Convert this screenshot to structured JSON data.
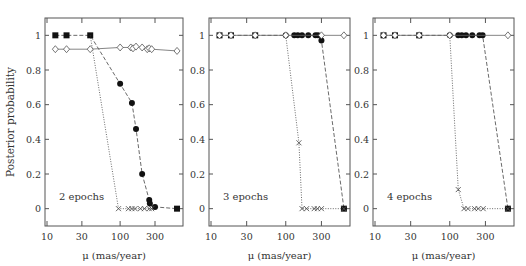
{
  "figure": {
    "ylabel": "Posterior probability",
    "xlabel": "μ (mas/year)"
  },
  "chart_data": [
    {
      "type": "line",
      "title": "2 epochs",
      "xlabel": "μ (mas/year)",
      "ylabel": "Posterior probability",
      "xscale": "log",
      "xlim": [
        10,
        680
      ],
      "ylim": [
        -0.1,
        1.1
      ],
      "xticks": [
        10,
        30,
        100,
        300
      ],
      "yticks": [
        0,
        0.2,
        0.4,
        0.6,
        0.8,
        1
      ],
      "ytick_labels": [
        "0",
        "0.2",
        "0.4",
        "0.6",
        "0.8",
        "1"
      ],
      "series": [
        {
          "name": "filled",
          "marker": "square/circle filled",
          "line": "dashed",
          "x": [
            13,
            18.5,
            39,
            100,
            145,
            165,
            200,
            250,
            255,
            300,
            600
          ],
          "y": [
            1,
            1,
            1,
            0.72,
            0.61,
            0.46,
            0.2,
            0.05,
            0.03,
            0.01,
            0.0
          ]
        },
        {
          "name": "cross",
          "marker": "x",
          "line": "dotted",
          "x": [
            39,
            95,
            130,
            145,
            160,
            190,
            215,
            250,
            270
          ],
          "y": [
            1,
            0,
            0,
            0,
            0,
            0,
            0,
            0,
            0
          ]
        },
        {
          "name": "open",
          "marker": "diamond open",
          "line": "solid",
          "x": [
            13,
            18.5,
            39,
            100,
            140,
            150,
            165,
            200,
            235,
            250,
            270,
            600
          ],
          "y": [
            0.92,
            0.92,
            0.92,
            0.93,
            0.93,
            0.925,
            0.935,
            0.93,
            0.92,
            0.925,
            0.92,
            0.91
          ]
        }
      ]
    },
    {
      "type": "line",
      "title": "3 epochs",
      "xlabel": "μ (mas/year)",
      "xscale": "log",
      "xlim": [
        10,
        680
      ],
      "ylim": [
        -0.1,
        1.1
      ],
      "xticks": [
        10,
        30,
        100,
        300
      ],
      "yticks": [
        0,
        0.2,
        0.4,
        0.6,
        0.8,
        1
      ],
      "ytick_labels": [
        "0",
        "0.2",
        "0.4",
        "0.6",
        "0.8",
        "1"
      ],
      "series": [
        {
          "name": "filled",
          "marker": "square/circle filled",
          "line": "dashed",
          "x": [
            13,
            18.5,
            39,
            100,
            130,
            145,
            165,
            200,
            250,
            270,
            300,
            600
          ],
          "y": [
            1,
            1,
            1,
            1,
            1,
            1,
            1,
            1,
            1,
            1,
            0.97,
            0.0
          ]
        },
        {
          "name": "cross",
          "marker": "x",
          "line": "dotted",
          "x": [
            100,
            150,
            165,
            190,
            240,
            265,
            300,
            600
          ],
          "y": [
            1,
            0.38,
            0,
            0,
            0,
            0,
            0,
            0
          ]
        },
        {
          "name": "open",
          "marker": "diamond open",
          "line": "solid",
          "x": [
            13,
            18.5,
            39,
            100,
            300,
            600
          ],
          "y": [
            1,
            1,
            1,
            1,
            1,
            1
          ]
        }
      ]
    },
    {
      "type": "line",
      "title": "4 epochs",
      "xlabel": "μ (mas/year)",
      "xscale": "log",
      "xlim": [
        10,
        680
      ],
      "ylim": [
        -0.1,
        1.1
      ],
      "xticks": [
        10,
        30,
        100,
        300
      ],
      "yticks": [
        0,
        0.2,
        0.4,
        0.6,
        0.8,
        1
      ],
      "ytick_labels": [
        "0",
        "0.2",
        "0.4",
        "0.6",
        "0.8",
        "1"
      ],
      "series": [
        {
          "name": "filled",
          "marker": "square/circle filled",
          "line": "dashed",
          "x": [
            13,
            18.5,
            39,
            100,
            130,
            145,
            165,
            200,
            250,
            275,
            600
          ],
          "y": [
            1,
            1,
            1,
            1,
            1,
            1,
            1,
            1,
            1,
            1,
            0.0
          ]
        },
        {
          "name": "cross",
          "marker": "x",
          "line": "dotted",
          "x": [
            100,
            130,
            155,
            175,
            215,
            240,
            280,
            600
          ],
          "y": [
            1,
            0.11,
            0,
            0,
            0,
            0,
            0,
            0
          ]
        },
        {
          "name": "open",
          "marker": "diamond open",
          "line": "solid",
          "x": [
            13,
            18.5,
            39,
            100,
            600
          ],
          "y": [
            1,
            1,
            1,
            1,
            1
          ]
        }
      ]
    }
  ]
}
